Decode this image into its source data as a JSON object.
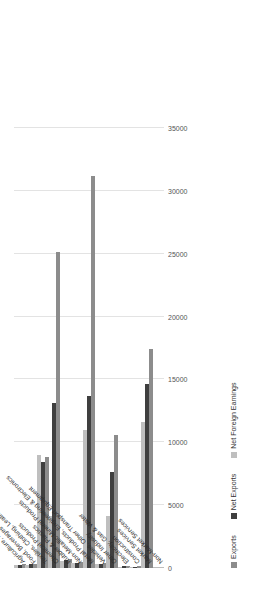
{
  "chart_data": {
    "type": "bar",
    "orientation": "horizontal-rotated",
    "title": "",
    "subtitle": "",
    "xlabel": "",
    "ylabel": "",
    "ylim": [
      0,
      35000
    ],
    "grid": true,
    "legend_position": "bottom",
    "tick_labels": [
      "0",
      "5000",
      "10000",
      "15000",
      "20000",
      "25000",
      "30000",
      "35000"
    ],
    "tick_values": [
      0,
      5000,
      10000,
      15000,
      20000,
      25000,
      30000,
      35000
    ],
    "categories": [
      "Agriculture, Forestry & Fishing",
      "Food, Beverages & Tobacco",
      "Textiles, Clothing, Leather Products",
      "Chemical Products",
      "Rubber & Plastics",
      "Non-Metallic Mineral Products",
      "Metal Products, Engineering & Electronics",
      "Vehicles, Other Transport Equipment",
      "Other Industry",
      "Electricity, Gas & Water",
      "Construction",
      "Market Services",
      "Non-Market Services"
    ],
    "series": [
      {
        "name": "Exports",
        "color": "#8c8c8c",
        "values": [
          300,
          350,
          8800,
          25100,
          700,
          500,
          31200,
          400,
          10600,
          150,
          120,
          17400,
          0
        ]
      },
      {
        "name": "Net Exports",
        "color": "#3f3f3f",
        "values": [
          250,
          300,
          8400,
          13100,
          600,
          420,
          13700,
          330,
          7600,
          120,
          100,
          14600,
          0
        ]
      },
      {
        "name": "Net Foreign Earnings",
        "color": "#bfbfbf",
        "values": [
          200,
          260,
          9000,
          4100,
          520,
          360,
          11000,
          280,
          4100,
          100,
          90,
          11600,
          0
        ]
      }
    ]
  },
  "legend": {
    "items": [
      {
        "label": "Exports",
        "color": "#8c8c8c"
      },
      {
        "label": "Net Exports",
        "color": "#3f3f3f"
      },
      {
        "label": "Net Foreign Earnings",
        "color": "#bfbfbf"
      }
    ]
  }
}
